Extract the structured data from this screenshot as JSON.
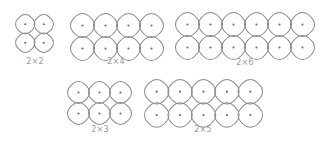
{
  "colors": {
    "stroke": "#8a8a8a",
    "dot": "#6e6e6e",
    "label": "#9a9a9a",
    "background": "#ffffff"
  },
  "shapes": [
    {
      "id": "2x2",
      "label": "2×2",
      "rows": 2,
      "cols": 2,
      "x": 16,
      "y": 15,
      "pitch": 18.5
    },
    {
      "id": "2x4",
      "label": "2×4",
      "rows": 2,
      "cols": 4,
      "x": 71,
      "y": 14,
      "pitch": 23
    },
    {
      "id": "2x6",
      "label": "2×6",
      "rows": 2,
      "cols": 6,
      "x": 176,
      "y": 13,
      "pitch": 23
    },
    {
      "id": "2x3",
      "label": "2×3",
      "rows": 2,
      "cols": 3,
      "x": 68,
      "y": 82,
      "pitch": 21
    },
    {
      "id": "2x5",
      "label": "2×5",
      "rows": 2,
      "cols": 5,
      "x": 145,
      "y": 80,
      "pitch": 23.4
    }
  ],
  "labels": {
    "2x2": "2×2",
    "2x4": "2×4",
    "2x6": "2×6",
    "2x3": "2×3",
    "2x5": "2×5"
  }
}
